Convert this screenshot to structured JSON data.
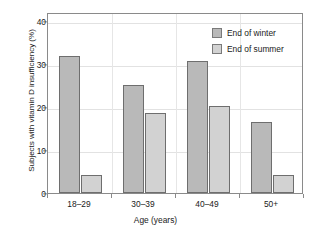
{
  "chart_data": {
    "type": "bar",
    "title": "",
    "xlabel": "Age (years)",
    "ylabel": "Subjects with vitamin D insufficiency (%)",
    "categories": [
      "18–29",
      "30–39",
      "40–49",
      "50+"
    ],
    "series": [
      {
        "name": "End of winter",
        "values": [
          31.9,
          25.0,
          30.7,
          16.4
        ],
        "color": "#b9b9b9"
      },
      {
        "name": "End of summer",
        "values": [
          4.1,
          18.6,
          20.1,
          4.1
        ],
        "color": "#d2d2d2"
      }
    ],
    "ylim": [
      0,
      42
    ],
    "yticks": [
      0,
      10,
      20,
      30,
      40
    ],
    "ytick_labels": [
      "0",
      "10",
      "20",
      "30",
      "40"
    ],
    "grid": true,
    "legend_position": "upper right"
  },
  "legend": {
    "entries": [
      {
        "label": "End of winter"
      },
      {
        "label": "End of summer"
      }
    ]
  },
  "axes": {
    "y_title": "Subjects with vitamin D insufficiency (%)",
    "x_title": "Age (years)"
  }
}
